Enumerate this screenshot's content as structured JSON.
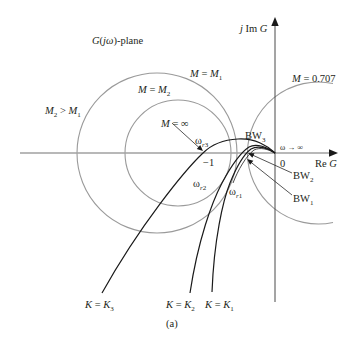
{
  "figure": {
    "caption": "(a)",
    "colors": {
      "circles": "#9a9a9a",
      "real_axis": "#a0a0a0",
      "imag_axis": "#4a4a4a",
      "curves": "#1a1a1a",
      "text": "#231f20"
    },
    "circles": [
      {
        "name": "M = M1"
      },
      {
        "name": "M = M2"
      },
      {
        "name": "M = 0.707"
      }
    ],
    "curves": [
      {
        "name": "K = K3"
      },
      {
        "name": "K = K2"
      },
      {
        "name": "K = K1"
      }
    ]
  },
  "labels": {
    "plane": [
      "G",
      "(",
      "jω",
      ")-plane"
    ],
    "imag_axis": [
      "j",
      " Im ",
      "G"
    ],
    "real_axis": [
      "Re ",
      "G"
    ],
    "origin": "0",
    "minus_one": "−1",
    "m1": [
      "M",
      " = ",
      "M",
      "1"
    ],
    "m2": [
      "M",
      " = ",
      "M",
      "2"
    ],
    "m2_gt_m1": [
      "M",
      "2",
      " > ",
      "M",
      "1"
    ],
    "m_inf": [
      "M",
      " = ∞"
    ],
    "m_0707": [
      "M",
      " = 0.707"
    ],
    "omega_inf": "ω → ∞",
    "bw3": [
      "BW",
      "3"
    ],
    "bw2": [
      "BW",
      "2"
    ],
    "bw1": [
      "BW",
      "1"
    ],
    "wr3": [
      "ω",
      "r",
      "3"
    ],
    "wr2": [
      "ω",
      "r",
      "2"
    ],
    "wr1": [
      "ω",
      "r",
      "1"
    ],
    "k3": [
      "K",
      " = ",
      "K",
      "3"
    ],
    "k2": [
      "K",
      " = ",
      "K",
      "2"
    ],
    "k1": [
      "K",
      " = ",
      "K",
      "1"
    ]
  }
}
